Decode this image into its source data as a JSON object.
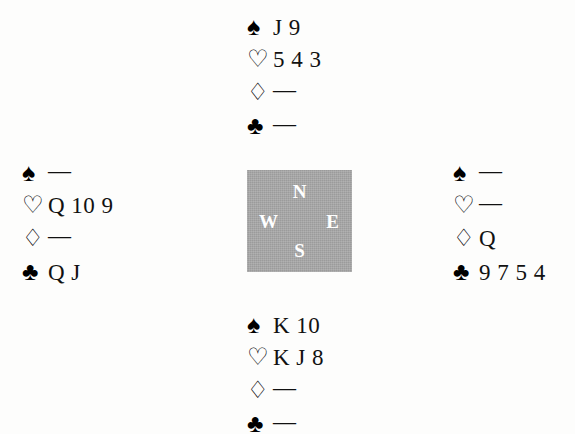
{
  "diagram": {
    "type": "bridge-hand-diagram",
    "suit_symbols": {
      "spades": "♠",
      "hearts": "♡",
      "diamonds": "♢",
      "clubs": "♣"
    },
    "void_mark": "—",
    "compass": {
      "north": "N",
      "east": "E",
      "south": "S",
      "west": "W",
      "background_color": "#a9a9a9",
      "letter_color": "#ffffff"
    },
    "hands": {
      "north": {
        "label": "North",
        "spades": "J 9",
        "hearts": "5 4 3",
        "diamonds": "—",
        "clubs": "—"
      },
      "west": {
        "label": "West",
        "spades": "—",
        "hearts": "Q 10 9",
        "diamonds": "—",
        "clubs": "Q J"
      },
      "east": {
        "label": "East",
        "spades": "—",
        "hearts": "—",
        "diamonds": "Q",
        "clubs": "9 7 5 4"
      },
      "south": {
        "label": "South",
        "spades": "K 10",
        "hearts": "K J 8",
        "diamonds": "—",
        "clubs": "—"
      }
    }
  }
}
